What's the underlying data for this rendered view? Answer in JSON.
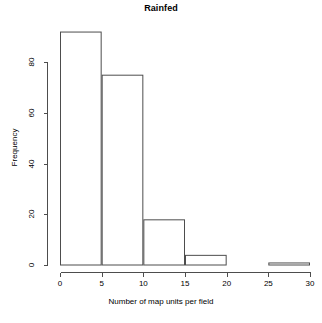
{
  "chart_data": {
    "type": "bar",
    "title": "Rainfed",
    "xlabel": "Number of map units per field",
    "ylabel": "Frequency",
    "bin_edges": [
      0,
      5,
      10,
      15,
      20,
      25,
      30
    ],
    "categories": [
      "0-5",
      "5-10",
      "10-15",
      "15-20",
      "20-25",
      "25-30"
    ],
    "values": [
      92,
      75,
      18,
      4,
      0,
      1
    ],
    "xlim": [
      0,
      30
    ],
    "ylim": [
      0,
      92
    ],
    "xticks": [
      0,
      5,
      10,
      15,
      20,
      25,
      30
    ],
    "yticks": [
      0,
      20,
      40,
      60,
      80
    ],
    "grid": false,
    "legend": false,
    "bar_fill": "#ffffff",
    "bar_stroke": "#4d4d4d"
  },
  "axes": {
    "x_tick_labels": [
      "0",
      "5",
      "10",
      "15",
      "20",
      "25",
      "30"
    ],
    "y_tick_labels": [
      "0",
      "20",
      "40",
      "60",
      "80"
    ]
  }
}
